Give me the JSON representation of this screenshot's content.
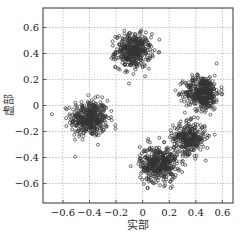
{
  "chart_data": {
    "type": "scatter",
    "title": "",
    "xlabel": "实部",
    "ylabel": "虚部",
    "xlim": [
      -0.75,
      0.68
    ],
    "ylim": [
      -0.75,
      0.75
    ],
    "xticks": [
      -0.6,
      -0.4,
      -0.2,
      0,
      0.2,
      0.4,
      0.6
    ],
    "xtick_labels": [
      "-0.6",
      "-0.4",
      "-0.2",
      "0",
      "0.2",
      "0.4",
      "0.6"
    ],
    "yticks": [
      -0.6,
      -0.4,
      -0.2,
      0,
      0.2,
      0.4,
      0.6
    ],
    "ytick_labels": [
      "-0.6",
      "-0.4",
      "-0.2",
      "0",
      "0.2",
      "0.4",
      "0.6"
    ],
    "grid": true,
    "legend": null,
    "marker": "open-circle",
    "marker_color": "#333333",
    "clusters": [
      {
        "center": [
          -0.4,
          -0.1
        ],
        "spread": 0.07,
        "points": 420
      },
      {
        "center": [
          -0.07,
          0.42
        ],
        "spread": 0.065,
        "points": 400
      },
      {
        "center": [
          0.45,
          0.1
        ],
        "spread": 0.065,
        "points": 400
      },
      {
        "center": [
          0.35,
          -0.25
        ],
        "spread": 0.06,
        "points": 300
      },
      {
        "center": [
          0.12,
          -0.45
        ],
        "spread": 0.07,
        "points": 420
      }
    ]
  }
}
